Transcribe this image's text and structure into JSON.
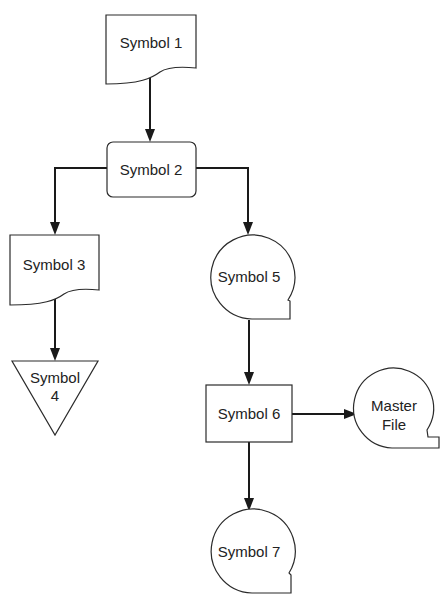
{
  "diagram": {
    "type": "flowchart",
    "nodes": [
      {
        "id": "s1",
        "shape": "document",
        "label": "Symbol 1"
      },
      {
        "id": "s2",
        "shape": "rounded-rect",
        "label": "Symbol 2"
      },
      {
        "id": "s3",
        "shape": "document",
        "label": "Symbol 3"
      },
      {
        "id": "s4",
        "shape": "inverted-triangle",
        "label_line1": "Symbol",
        "label_line2": "4"
      },
      {
        "id": "s5",
        "shape": "magnetic-tape",
        "label": "Symbol 5"
      },
      {
        "id": "s6",
        "shape": "rectangle",
        "label": "Symbol 6"
      },
      {
        "id": "mf",
        "shape": "magnetic-tape",
        "label_line1": "Master",
        "label_line2": "File"
      },
      {
        "id": "s7",
        "shape": "magnetic-tape",
        "label": "Symbol 7"
      }
    ],
    "edges": [
      {
        "from": "s1",
        "to": "s2"
      },
      {
        "from": "s2",
        "to": "s3"
      },
      {
        "from": "s2",
        "to": "s5"
      },
      {
        "from": "s3",
        "to": "s4"
      },
      {
        "from": "s5",
        "to": "s6"
      },
      {
        "from": "s6",
        "to": "mf"
      },
      {
        "from": "s6",
        "to": "s7"
      }
    ]
  }
}
